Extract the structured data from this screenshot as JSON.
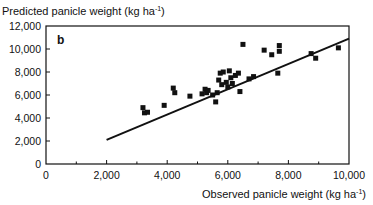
{
  "chart_data": {
    "type": "scatter",
    "title": "",
    "panel_label": "b",
    "ylabel": "Predicted panicle weight (kg ha",
    "ylabel_sup": "-1",
    "ylabel_end": ")",
    "xlabel": "Observed panicle weight (kg ha",
    "xlabel_sup": "-1",
    "xlabel_end": ")",
    "xlim": [
      0,
      10000
    ],
    "ylim": [
      0,
      12000
    ],
    "xticks": [
      0,
      2000,
      4000,
      6000,
      8000,
      10000
    ],
    "xtick_labels": [
      "0",
      "2,000",
      "4,000",
      "6,000",
      "8,000",
      "10,000"
    ],
    "xminor_ticks": [
      1000,
      3000,
      5000,
      7000,
      9000
    ],
    "yticks": [
      0,
      2000,
      4000,
      6000,
      8000,
      10000,
      12000
    ],
    "ytick_labels": [
      "0",
      "2,000",
      "4,000",
      "6,000",
      "8,000",
      "10,000",
      "12,000"
    ],
    "grid": false,
    "points": [
      {
        "x": 3200,
        "y": 4900
      },
      {
        "x": 3250,
        "y": 4450
      },
      {
        "x": 3350,
        "y": 4500
      },
      {
        "x": 3900,
        "y": 5100
      },
      {
        "x": 4200,
        "y": 6600
      },
      {
        "x": 4250,
        "y": 6200
      },
      {
        "x": 4750,
        "y": 5900
      },
      {
        "x": 5150,
        "y": 6100
      },
      {
        "x": 5250,
        "y": 6500
      },
      {
        "x": 5300,
        "y": 6200
      },
      {
        "x": 5350,
        "y": 6400
      },
      {
        "x": 5500,
        "y": 6000
      },
      {
        "x": 5600,
        "y": 5400
      },
      {
        "x": 5650,
        "y": 6200
      },
      {
        "x": 5700,
        "y": 7300
      },
      {
        "x": 5750,
        "y": 7900
      },
      {
        "x": 5850,
        "y": 8000
      },
      {
        "x": 5800,
        "y": 6900
      },
      {
        "x": 5950,
        "y": 7100
      },
      {
        "x": 6000,
        "y": 6700
      },
      {
        "x": 6050,
        "y": 8100
      },
      {
        "x": 6100,
        "y": 7500
      },
      {
        "x": 6150,
        "y": 7000
      },
      {
        "x": 6250,
        "y": 7700
      },
      {
        "x": 6350,
        "y": 7900
      },
      {
        "x": 6400,
        "y": 6300
      },
      {
        "x": 6500,
        "y": 10400
      },
      {
        "x": 6700,
        "y": 7400
      },
      {
        "x": 6850,
        "y": 7600
      },
      {
        "x": 7200,
        "y": 9900
      },
      {
        "x": 7450,
        "y": 9500
      },
      {
        "x": 7700,
        "y": 10300
      },
      {
        "x": 7700,
        "y": 9800
      },
      {
        "x": 7650,
        "y": 7900
      },
      {
        "x": 8750,
        "y": 9600
      },
      {
        "x": 8900,
        "y": 9200
      },
      {
        "x": 9650,
        "y": 10100
      }
    ],
    "regression_line": {
      "x": [
        2000,
        10000
      ],
      "y": [
        2100,
        10900
      ]
    }
  }
}
